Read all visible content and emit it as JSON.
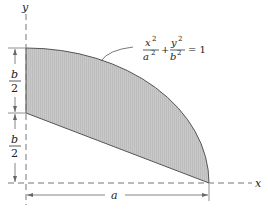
{
  "diagram": {
    "type": "area-figure",
    "axes": {
      "x_label": "x",
      "y_label": "y"
    },
    "dimensions": {
      "horizontal": "a",
      "upper_vertical": {
        "num": "b",
        "den": "2"
      },
      "lower_vertical": {
        "num": "b",
        "den": "2"
      }
    },
    "equation": {
      "term1_num": "x",
      "term1_num_exp": "2",
      "term1_den": "a",
      "term1_den_exp": "2",
      "plus": "+",
      "term2_num": "y",
      "term2_num_exp": "2",
      "term2_den": "b",
      "term2_den_exp": "2",
      "equals": "= 1"
    },
    "colors": {
      "fill": "#c8c8c8",
      "stroke": "#444444",
      "dash": "#777777"
    }
  }
}
